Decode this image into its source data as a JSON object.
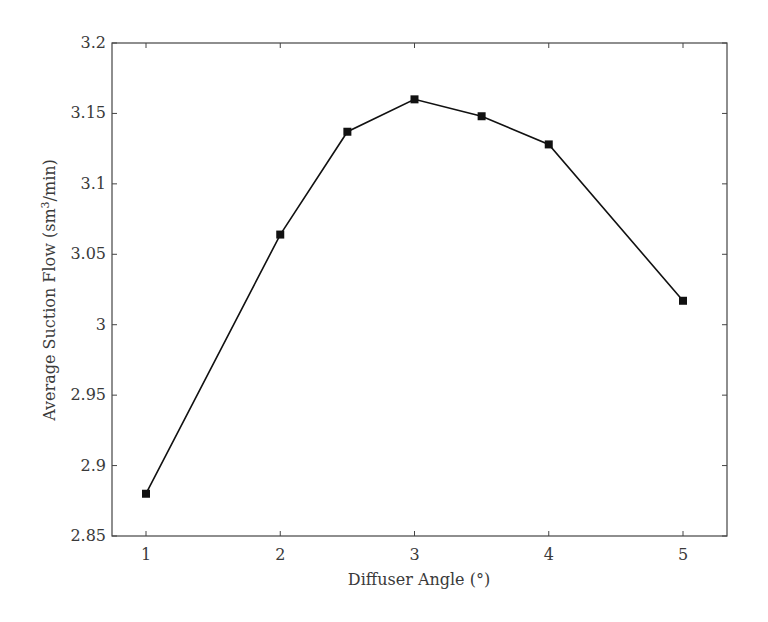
{
  "chart_data": {
    "type": "line",
    "title": "",
    "xlabel": "Diffuser Angle (°)",
    "ylabel": "Average Suction Flow (sm³/min)",
    "ylabel_parts": {
      "pre": "Average Suction Flow (sm",
      "sup": "3",
      "post": "/min)"
    },
    "xlim": [
      0.75,
      5.33
    ],
    "ylim": [
      2.85,
      3.2
    ],
    "xticks": [
      1,
      2,
      3,
      4,
      5
    ],
    "xtick_labels": [
      "1",
      "2",
      "3",
      "4",
      "5"
    ],
    "yticks": [
      2.85,
      2.9,
      2.95,
      3.0,
      3.05,
      3.1,
      3.15,
      3.2
    ],
    "ytick_labels": [
      "2.85",
      "2.9",
      "2.95",
      "3",
      "3.05",
      "3.1",
      "3.15",
      "3.2"
    ],
    "grid": false,
    "legend": null,
    "marker": "square",
    "series": [
      {
        "name": "Average Suction Flow",
        "color": "#111111",
        "x": [
          1,
          2,
          2.5,
          3,
          3.5,
          4,
          5
        ],
        "y": [
          2.88,
          3.064,
          3.137,
          3.16,
          3.148,
          3.128,
          3.017
        ]
      }
    ]
  }
}
